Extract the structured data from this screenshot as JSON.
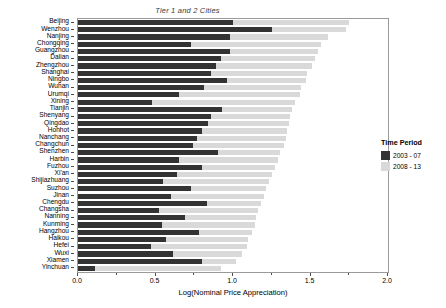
{
  "chart_data": {
    "type": "bar",
    "orientation": "horizontal",
    "stacked": true,
    "title": "Tier 1 and 2 Cities",
    "xlabel": "Log(Nominal Price Appreciation)",
    "ylabel": "",
    "xlim": [
      0.0,
      2.0
    ],
    "xticks": [
      0.0,
      0.5,
      1.0,
      1.5,
      2.0
    ],
    "xtick_labels": [
      "0.0",
      "0.5",
      "1.0",
      "1.5",
      "2.0"
    ],
    "grid": false,
    "legend": {
      "title": "Time Period",
      "position": "right",
      "entries": [
        {
          "name": "2003 - 07",
          "color": "#333333"
        },
        {
          "name": "2008 - 13",
          "color": "#d9d9d9"
        }
      ]
    },
    "categories": [
      "Beijing",
      "Wenzhou",
      "Nanjing",
      "Chongqing",
      "Guangzhou",
      "Dalian",
      "Zhengzhou",
      "Shanghai",
      "Ningbo",
      "Wuhan",
      "Urumqi",
      "Xining",
      "Tianjin",
      "Shenyang",
      "Qingdao",
      "Hohhot",
      "Nanchang",
      "Changchun",
      "Shenzhen",
      "Harbin",
      "Fuzhou",
      "Xi'an",
      "Shijiazhuang",
      "Suzhou",
      "Jinan",
      "Chengdu",
      "Changsha",
      "Nanning",
      "Kunming",
      "Hangzhou",
      "Haikou",
      "Hefei",
      "Wuxi",
      "Xiamen",
      "Yinchuan"
    ],
    "series": [
      {
        "name": "2003 - 07",
        "color": "#333333",
        "values": [
          1.0,
          1.25,
          0.98,
          0.73,
          0.98,
          0.92,
          0.89,
          0.86,
          0.96,
          0.81,
          0.65,
          0.48,
          0.93,
          0.86,
          0.84,
          0.8,
          0.77,
          0.74,
          0.9,
          0.65,
          0.8,
          0.64,
          0.55,
          0.73,
          0.6,
          0.83,
          0.52,
          0.69,
          0.54,
          0.78,
          0.57,
          0.47,
          0.61,
          0.8,
          0.11
        ]
      },
      {
        "name": "2008 - 13",
        "color": "#d9d9d9",
        "values": [
          0.75,
          0.48,
          0.63,
          0.84,
          0.57,
          0.61,
          0.62,
          0.62,
          0.51,
          0.63,
          0.78,
          0.92,
          0.45,
          0.51,
          0.52,
          0.55,
          0.57,
          0.59,
          0.4,
          0.64,
          0.47,
          0.61,
          0.68,
          0.48,
          0.6,
          0.35,
          0.64,
          0.46,
          0.6,
          0.34,
          0.53,
          0.62,
          0.45,
          0.22,
          0.81
        ]
      }
    ]
  }
}
